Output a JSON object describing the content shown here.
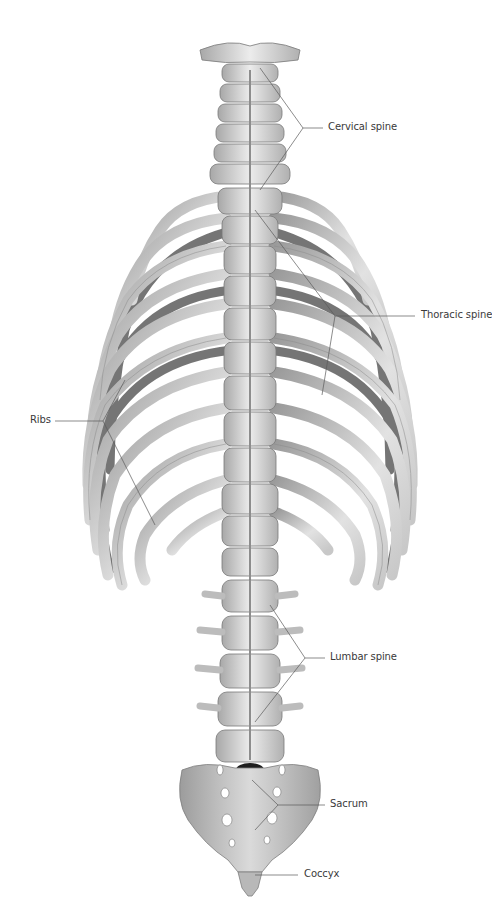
{
  "figure": {
    "colors": {
      "background": "#ffffff",
      "bone_light": "#e6e6e6",
      "bone_mid": "#c4c4c4",
      "bone_dark": "#6a6a6a",
      "leader_line": "#5a5a5a",
      "label_text": "#3a3a3a"
    }
  },
  "labels": {
    "cervical": "Cervical spine",
    "thoracic": "Thoracic spine",
    "ribs": "Ribs",
    "lumbar": "Lumbar spine",
    "sacrum": "Sacrum",
    "coccyx": "Coccyx"
  }
}
